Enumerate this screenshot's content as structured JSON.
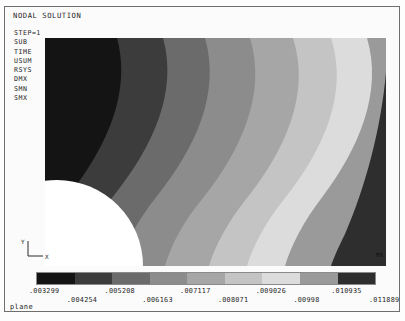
{
  "window": {
    "title": "NODAL SOLUTION",
    "footer_label": "plane"
  },
  "info": {
    "lines": [
      "STEP=1",
      "SUB",
      "TIME",
      "USUM",
      "RSYS",
      "DMX",
      "SMN",
      "SMX"
    ]
  },
  "plot": {
    "mx_marker": "MX",
    "axis_x_label": "X",
    "axis_y_label": "Y",
    "hole_description": "quarter-circle hole lower-left"
  },
  "colors": {
    "band_1": "#141414",
    "band_2": "#3c3c3c",
    "band_3": "#6b6b6b",
    "band_4": "#8c8c8c",
    "band_5": "#a6a6a6",
    "band_6": "#c4c4c4",
    "band_7": "#dcdcdc",
    "band_8": "#9a9a9a",
    "band_9": "#2e2e2e",
    "hole_fill": "#ffffff",
    "frame": "#6e6e6e",
    "text": "#222222"
  },
  "chart_data": {
    "type": "heatmap",
    "title": "NODAL SOLUTION",
    "subtitle": "USUM contour plot",
    "xlabel": "X",
    "ylabel": "Y",
    "legend_position": "bottom",
    "grid": false,
    "contour_min": 0.003299,
    "contour_max": 0.011889,
    "band_count": 9,
    "legend_values": [
      ".003299",
      ".004254",
      ".005208",
      ".006163",
      ".007117",
      ".008071",
      ".009026",
      ".00998",
      ".010935",
      ".011889"
    ],
    "legend_values_numeric": [
      0.003299,
      0.004254,
      0.005208,
      0.006163,
      0.007117,
      0.008071,
      0.009026,
      0.00998,
      0.010935,
      0.011889
    ],
    "band_colors": [
      "#141414",
      "#3c3c3c",
      "#6b6b6b",
      "#8c8c8c",
      "#a6a6a6",
      "#c4c4c4",
      "#dcdcdc",
      "#9a9a9a",
      "#2e2e2e"
    ],
    "band_ranges": [
      [
        0.003299,
        0.004254
      ],
      [
        0.004254,
        0.005208
      ],
      [
        0.005208,
        0.006163
      ],
      [
        0.006163,
        0.007117
      ],
      [
        0.007117,
        0.008071
      ],
      [
        0.008071,
        0.009026
      ],
      [
        0.009026,
        0.00998
      ],
      [
        0.00998,
        0.010935
      ],
      [
        0.010935,
        0.011889
      ]
    ]
  }
}
